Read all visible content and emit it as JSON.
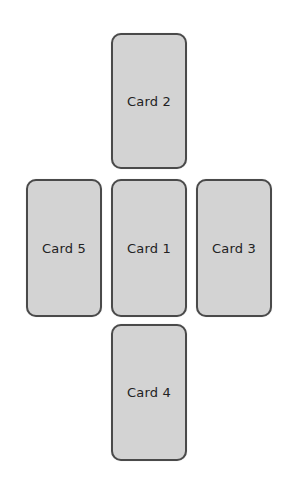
{
  "diagram": {
    "type": "card-spread-cross",
    "cards": [
      {
        "id": 2,
        "label": "Card 2",
        "position": "top",
        "x": 111,
        "y": 33,
        "w": 76,
        "h": 136
      },
      {
        "id": 5,
        "label": "Card 5",
        "position": "left",
        "x": 26,
        "y": 179,
        "w": 76,
        "h": 138
      },
      {
        "id": 1,
        "label": "Card 1",
        "position": "center",
        "x": 111,
        "y": 179,
        "w": 76,
        "h": 138
      },
      {
        "id": 3,
        "label": "Card 3",
        "position": "right",
        "x": 196,
        "y": 179,
        "w": 76,
        "h": 138
      },
      {
        "id": 4,
        "label": "Card 4",
        "position": "bottom",
        "x": 111,
        "y": 324,
        "w": 76,
        "h": 137
      }
    ],
    "colors": {
      "card_fill": "#d3d3d3",
      "card_border": "#4a4a4a",
      "label": "#222222",
      "background": "#ffffff"
    }
  }
}
